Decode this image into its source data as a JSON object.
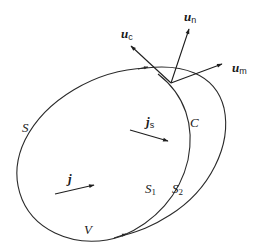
{
  "diagram": {
    "regions": {
      "surface_S": "S",
      "curve_C": "C",
      "volume_V": "V"
    },
    "surfaces": {
      "S1": {
        "base": "S",
        "sub": "1"
      },
      "S2": {
        "base": "S",
        "sub": "2"
      }
    },
    "vectors": {
      "u_c": {
        "base": "u",
        "sub": "c"
      },
      "u_n": {
        "base": "u",
        "sub": "n"
      },
      "u_m": {
        "base": "u",
        "sub": "m"
      },
      "j_s": {
        "base": "j",
        "sub": "s"
      },
      "j": {
        "base": "j"
      }
    },
    "colors": {
      "stroke": "#2a2a2a",
      "background": "#ffffff"
    }
  }
}
